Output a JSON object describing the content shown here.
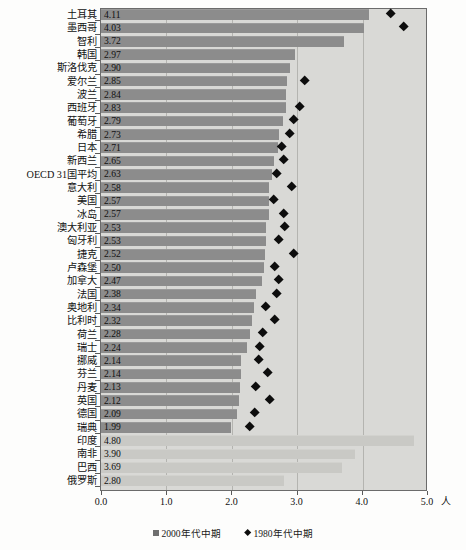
{
  "chart_data": {
    "type": "bar",
    "title": "",
    "xlabel": "",
    "ylabel": "",
    "unit_label": "人",
    "xlim": [
      0.0,
      5.0
    ],
    "xticks": [
      0.0,
      1.0,
      2.0,
      3.0,
      4.0,
      5.0
    ],
    "xtick_labels": [
      "0.0",
      "1.0",
      "2.0",
      "3.0",
      "4.0",
      "5.0"
    ],
    "grid": true,
    "legend_position": "bottom",
    "orientation": "horizontal",
    "categories": [
      "土耳其",
      "墨西哥",
      "智利",
      "韩国",
      "斯洛伐克",
      "爱尔兰",
      "波兰",
      "西班牙",
      "葡萄牙",
      "希腊",
      "日本",
      "新西兰",
      "OECD 31国平均",
      "意大利",
      "美国",
      "冰岛",
      "澳大利亚",
      "匈牙利",
      "捷克",
      "卢森堡",
      "加拿大",
      "法国",
      "奥地利",
      "比利时",
      "荷兰",
      "瑞士",
      "挪威",
      "芬兰",
      "丹麦",
      "英国",
      "德国",
      "瑞典",
      "印度",
      "南非",
      "巴西",
      "俄罗斯"
    ],
    "series": [
      {
        "name": "2000年代中期",
        "marker": "square",
        "color": "#8c8c8c",
        "values": [
          4.11,
          4.03,
          3.72,
          2.97,
          2.9,
          2.85,
          2.84,
          2.83,
          2.79,
          2.73,
          2.71,
          2.65,
          2.63,
          2.58,
          2.57,
          2.57,
          2.53,
          2.53,
          2.52,
          2.5,
          2.47,
          2.38,
          2.34,
          2.32,
          2.28,
          2.24,
          2.14,
          2.14,
          2.13,
          2.12,
          2.09,
          1.99,
          4.8,
          3.9,
          3.69,
          2.8
        ],
        "value_labels": [
          "4.11",
          "4.03",
          "3.72",
          "2.97",
          "2.90",
          "2.85",
          "2.84",
          "2.83",
          "2.79",
          "2.73",
          "2.71",
          "2.65",
          "2.63",
          "2.58",
          "2.57",
          "2.57",
          "2.53",
          "2.53",
          "2.52",
          "2.50",
          "2.47",
          "2.38",
          "2.34",
          "2.32",
          "2.28",
          "2.24",
          "2.14",
          "2.14",
          "2.13",
          "2.12",
          "2.09",
          "1.99",
          "4.80",
          "3.90",
          "3.69",
          "2.80"
        ]
      },
      {
        "name": "1980年代中期",
        "marker": "diamond",
        "color": "#0d0d0d",
        "values": [
          4.45,
          4.65,
          null,
          null,
          null,
          3.12,
          null,
          3.05,
          2.95,
          2.9,
          2.77,
          2.8,
          2.7,
          2.93,
          2.65,
          2.8,
          2.82,
          2.72,
          2.95,
          2.66,
          2.72,
          2.7,
          2.53,
          2.67,
          2.48,
          2.43,
          2.42,
          2.55,
          2.37,
          2.59,
          2.35,
          2.28,
          null,
          null,
          null,
          null
        ]
      }
    ],
    "notes": [
      "最后四行（印度、南非、巴西、俄罗斯）为非OECD国家，仅有浅色柱，无菱形标记"
    ]
  },
  "legend": {
    "items": [
      {
        "label": "2000年代中期",
        "marker": "square"
      },
      {
        "label": "1980年代中期",
        "marker": "diamond"
      }
    ]
  },
  "axis": {
    "unit": "人",
    "ticks": [
      "0.0",
      "1.0",
      "2.0",
      "3.0",
      "4.0",
      "5.0"
    ]
  },
  "caption": ""
}
